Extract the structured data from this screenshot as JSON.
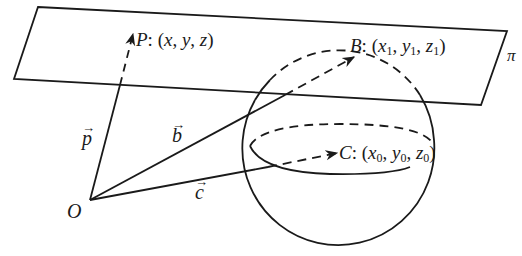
{
  "diagram": {
    "type": "geometry",
    "plane": {
      "label": "π",
      "color": "#1a1a1a"
    },
    "origin": {
      "label": "O"
    },
    "points": {
      "P": {
        "name": "P",
        "coords": "(x, y, z)",
        "x": "x",
        "y": "y",
        "z": "z"
      },
      "B": {
        "name": "B",
        "x": "x",
        "y": "y",
        "z": "z",
        "sub": "1"
      },
      "C": {
        "name": "C",
        "x": "x",
        "y": "y",
        "z": "z",
        "sub": "0"
      }
    },
    "vectors": {
      "p": {
        "label": "p",
        "arrow": "→"
      },
      "b": {
        "label": "b",
        "arrow": "→"
      },
      "c": {
        "label": "c",
        "arrow": "→"
      }
    },
    "punct": {
      "colon": ": (",
      "comma": ", ",
      "close": ")"
    },
    "stroke_color": "#1a1a1a"
  }
}
